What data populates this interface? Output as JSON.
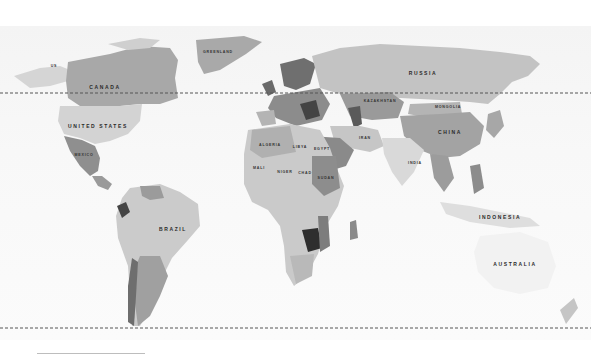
{
  "map": {
    "style": "grayscale political world map",
    "colors": {
      "ocean": "#f6f6f6",
      "land_light": "#d9d9d9",
      "land_mid": "#bdbdbd",
      "land_dark": "#8a8a8a",
      "land_darkest": "#2e2e2e",
      "dashed_line": "#555555"
    },
    "reference_lines": [
      {
        "name": "arctic-circle",
        "y": 93
      },
      {
        "name": "antarctic-circle",
        "y": 328
      }
    ],
    "country_labels": [
      {
        "id": "us-alaska",
        "text": "US",
        "x": 54,
        "y": 66,
        "size": "sm"
      },
      {
        "id": "canada",
        "text": "CANADA",
        "x": 105,
        "y": 87,
        "size": "lg"
      },
      {
        "id": "greenland",
        "text": "GREENLAND",
        "x": 218,
        "y": 52,
        "size": "sm"
      },
      {
        "id": "united-states",
        "text": "UNITED STATES",
        "x": 98,
        "y": 126,
        "size": "lg"
      },
      {
        "id": "mexico",
        "text": "MEXICO",
        "x": 84,
        "y": 155,
        "size": "sm"
      },
      {
        "id": "russia",
        "text": "RUSSIA",
        "x": 423,
        "y": 73,
        "size": "lg"
      },
      {
        "id": "kazakhstan",
        "text": "KAZAKHSTAN",
        "x": 380,
        "y": 101,
        "size": "sm"
      },
      {
        "id": "mongolia",
        "text": "MONGOLIA",
        "x": 448,
        "y": 107,
        "size": "sm"
      },
      {
        "id": "china",
        "text": "CHINA",
        "x": 450,
        "y": 132,
        "size": "lg"
      },
      {
        "id": "iran",
        "text": "IRAN",
        "x": 365,
        "y": 138,
        "size": "sm"
      },
      {
        "id": "india",
        "text": "INDIA",
        "x": 415,
        "y": 163,
        "size": "sm"
      },
      {
        "id": "algeria",
        "text": "ALGERIA",
        "x": 270,
        "y": 145,
        "size": "sm"
      },
      {
        "id": "libya",
        "text": "LIBYA",
        "x": 300,
        "y": 147,
        "size": "sm"
      },
      {
        "id": "egypt",
        "text": "EGYPT",
        "x": 322,
        "y": 149,
        "size": "sm"
      },
      {
        "id": "mali",
        "text": "MALI",
        "x": 259,
        "y": 168,
        "size": "sm"
      },
      {
        "id": "niger",
        "text": "NIGER",
        "x": 285,
        "y": 172,
        "size": "sm"
      },
      {
        "id": "chad",
        "text": "CHAD",
        "x": 305,
        "y": 173,
        "size": "sm"
      },
      {
        "id": "sudan",
        "text": "SUDAN",
        "x": 326,
        "y": 178,
        "size": "sm"
      },
      {
        "id": "brazil",
        "text": "BRAZIL",
        "x": 173,
        "y": 229,
        "size": "lg"
      },
      {
        "id": "indonesia",
        "text": "INDONESIA",
        "x": 500,
        "y": 217,
        "size": "lg"
      },
      {
        "id": "australia",
        "text": "AUSTRALIA",
        "x": 515,
        "y": 264,
        "size": "lg"
      }
    ]
  }
}
